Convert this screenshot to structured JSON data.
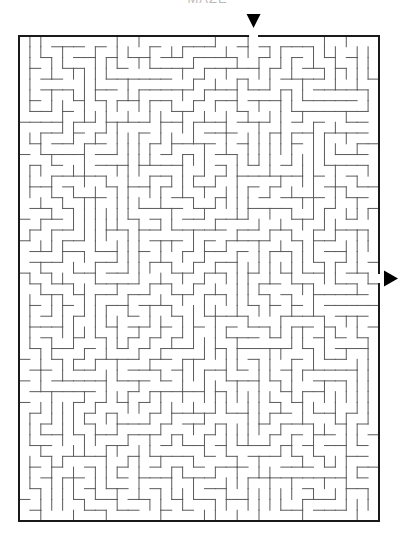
{
  "title": "MAZE",
  "maze": {
    "frame": {
      "x": 19,
      "y": 36,
      "width": 360,
      "height": 485
    },
    "cols": 33,
    "rows": 45,
    "entrance": {
      "side": "top",
      "col": 21,
      "arrow": "down"
    },
    "exit": {
      "side": "right",
      "row": 22,
      "arrow": "right"
    },
    "colors": {
      "border": "#1a1a1a",
      "wall": "#5a5a5a",
      "arrow": "#000000",
      "background": "#ffffff"
    },
    "seed": 7331
  }
}
